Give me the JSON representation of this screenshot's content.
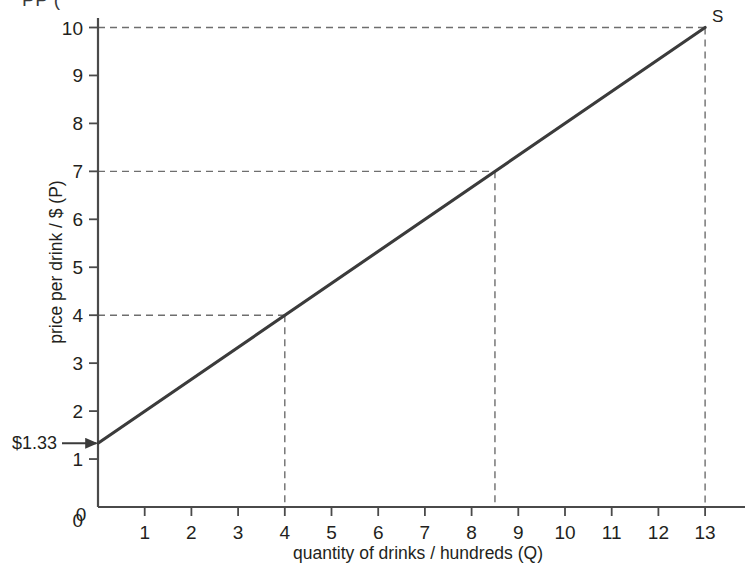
{
  "chart_data": {
    "type": "line",
    "title": "",
    "subtitle": "",
    "xlabel": "quantity of drinks / hundreds (Q)",
    "ylabel": "price per drink / $ (P)",
    "xlim": [
      0,
      13.6
    ],
    "ylim": [
      0,
      10.5
    ],
    "xticks": [
      0,
      1,
      2,
      3,
      4,
      5,
      6,
      7,
      8,
      9,
      10,
      11,
      12,
      13
    ],
    "xtick_labels": [
      "0",
      "1",
      "2",
      "3",
      "4",
      "5",
      "6",
      "7",
      "8",
      "9",
      "10",
      "11",
      "12",
      "13"
    ],
    "yticks": [
      0,
      1,
      2,
      3,
      4,
      5,
      6,
      7,
      8,
      9,
      10
    ],
    "ytick_labels": [
      "0",
      "1",
      "2",
      "3",
      "4",
      "5",
      "6",
      "7",
      "8",
      "9",
      "10"
    ],
    "grid": false,
    "legend_position": "none",
    "series": [
      {
        "name": "S",
        "label": "S",
        "type": "line",
        "color": "#3b3b3b",
        "points": [
          {
            "x": 0,
            "y": 1.33
          },
          {
            "x": 13,
            "y": 10
          }
        ]
      }
    ],
    "guide_lines": [
      {
        "name": "guide-p4",
        "price": 4,
        "quantity": 4
      },
      {
        "name": "guide-p7",
        "price": 7,
        "quantity": 8.5
      },
      {
        "name": "guide-p10",
        "price": 10,
        "quantity": 13
      }
    ],
    "annotations": [
      {
        "name": "intercept-annotation",
        "text": "$1.33",
        "value": 1.33,
        "points_to": {
          "x": 0,
          "y": 1.33
        }
      },
      {
        "name": "supply-curve-label",
        "text": "S",
        "points_to": {
          "x": 13,
          "y": 10
        }
      }
    ],
    "colors": {
      "curve": "#3b3b3b",
      "axis": "#4a4a4a",
      "dashed": "#6e6e6e",
      "text": "#231f20",
      "background": "#ffffff"
    }
  },
  "clipped_header": {
    "text": "PP ("
  }
}
